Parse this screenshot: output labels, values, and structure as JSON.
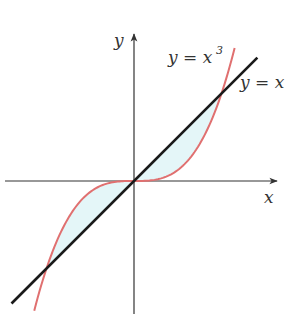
{
  "chart_data": {
    "type": "line",
    "title": "",
    "xlabel": "x",
    "ylabel": "y",
    "xlim": [
      -1.5,
      1.65
    ],
    "ylim": [
      -1.52,
      1.7
    ],
    "grid": false,
    "legend": null,
    "shaded_region": {
      "description": "Region enclosed between y = x and y = x^3",
      "between": [
        "y = x",
        "y = x^3"
      ],
      "x_range": [
        -1,
        1
      ],
      "color": "#e4f6f8"
    },
    "intersections": [
      [
        -1,
        -1
      ],
      [
        0,
        0
      ],
      [
        1,
        1
      ]
    ],
    "series": [
      {
        "name": "y = x",
        "function": "x",
        "color": "#1a1a1a",
        "x_range": [
          -1.4,
          1.41
        ],
        "points": [
          [
            -1.4,
            -1.4
          ],
          [
            0,
            0
          ],
          [
            1.41,
            1.41
          ]
        ]
      },
      {
        "name": "y = x^3",
        "function": "x^3",
        "color": "#e07070",
        "x_range": [
          -1.14,
          1.15
        ],
        "points": [
          [
            -1.14,
            -1.48
          ],
          [
            -1,
            -1
          ],
          [
            -0.5,
            -0.125
          ],
          [
            0,
            0
          ],
          [
            0.5,
            0.125
          ],
          [
            1,
            1
          ],
          [
            1.15,
            1.52
          ]
        ]
      }
    ],
    "annotations": [
      {
        "text": "y = x³",
        "near": "curve y = x^3 upper end"
      },
      {
        "text": "y = x",
        "near": "line y = x upper end"
      }
    ]
  },
  "labels": {
    "x_axis": "x",
    "y_axis": "y",
    "cubic_label": "y = x",
    "cubic_exp": "3",
    "line_label": "y = x"
  },
  "colors": {
    "axis": "#333333",
    "line": "#1a1a1a",
    "cubic": "#e07070",
    "fill": "#e4f6f8"
  }
}
